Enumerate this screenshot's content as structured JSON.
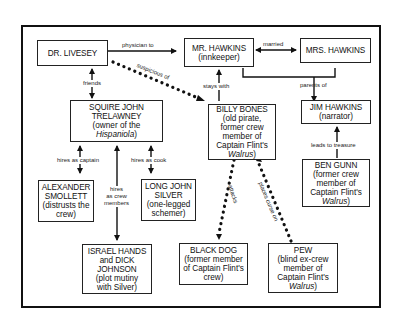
{
  "diagram": {
    "type": "character-relationship-map",
    "nodes": {
      "livesey": {
        "name": "DR. LIVESEY",
        "desc": ""
      },
      "mr_hawkins": {
        "name": "MR. HAWKINS",
        "desc": "(innkeeper)"
      },
      "mrs_hawkins": {
        "name": "MRS. HAWKINS",
        "desc": ""
      },
      "trelawney": {
        "name": "SQUIRE JOHN TRELAWNEY",
        "desc_pre": "(owner of the ",
        "desc_italic": "Hispaniola",
        "desc_post": ")"
      },
      "billy_bones": {
        "name": "BILLY BONES",
        "desc_pre": "(old pirate, former crew member of Captain Flint's ",
        "desc_italic": "Walrus",
        "desc_post": ")"
      },
      "jim_hawkins": {
        "name": "JIM HAWKINS",
        "desc": "(narrator)"
      },
      "ben_gunn": {
        "name": "BEN GUNN",
        "desc_pre": "(former crew member of Captain Flint's ",
        "desc_italic": "Walrus",
        "desc_post": ")"
      },
      "smollett": {
        "name": "ALEXANDER SMOLLETT",
        "desc": "(distrusts the crew)"
      },
      "silver": {
        "name": "LONG JOHN SILVER",
        "desc": "(one-legged schemer)"
      },
      "hands_johnson": {
        "name": "ISRAEL HANDS and DICK JOHNSON",
        "desc": "(plot mutiny with Silver)"
      },
      "black_dog": {
        "name": "BLACK DOG",
        "desc": "(former member of Captain Flint's crew)"
      },
      "pew": {
        "name": "PEW",
        "desc_pre": "(blind ex-crew member of Captain Flint's ",
        "desc_italic": "Walrus",
        "desc_post": ")"
      }
    },
    "edges": [
      {
        "from": "livesey",
        "to": "mr_hawkins",
        "label": "physician to",
        "style": "solid",
        "arrow": "forward"
      },
      {
        "from": "mr_hawkins",
        "to": "mrs_hawkins",
        "label": "married",
        "style": "solid",
        "arrow": "both"
      },
      {
        "from": "livesey",
        "to": "trelawney",
        "label": "friends",
        "style": "solid",
        "arrow": "both"
      },
      {
        "from": "livesey",
        "to": "billy_bones",
        "label": "suspicious of",
        "style": "dotted",
        "arrow": "forward"
      },
      {
        "from": "billy_bones",
        "to": "mr_hawkins",
        "label": "stays with",
        "style": "solid",
        "arrow": "forward"
      },
      {
        "from": "mr_hawkins+mrs_hawkins",
        "to": "jim_hawkins",
        "label": "parents of",
        "style": "solid",
        "arrow": "forward"
      },
      {
        "from": "ben_gunn",
        "to": "jim_hawkins",
        "label": "leads to treasure",
        "style": "solid",
        "arrow": "forward"
      },
      {
        "from": "trelawney",
        "to": "smollett",
        "label": "hires as captain",
        "style": "solid",
        "arrow": "both"
      },
      {
        "from": "trelawney",
        "to": "silver",
        "label": "hires as cook",
        "style": "solid",
        "arrow": "both"
      },
      {
        "from": "trelawney",
        "to": "hands_johnson",
        "label": "hires as crew members",
        "style": "solid",
        "arrow": "both"
      },
      {
        "from": "billy_bones",
        "to": "black_dog",
        "label": "attacks",
        "style": "dotted",
        "arrow": "forward"
      },
      {
        "from": "pew",
        "to": "billy_bones",
        "label": "places curse on",
        "style": "dotted",
        "arrow": "forward"
      }
    ],
    "labels": {
      "physician_to": "physician to",
      "married": "married",
      "friends": "friends",
      "suspicious_of": "suspicious of",
      "stays_with": "stays with",
      "parents_of": "parents of",
      "leads_to_treasure": "leads to treasure",
      "hires_as_captain": "hires as captain",
      "hires_as_cook": "hires as cook",
      "hires_line1": "hires",
      "hires_line2": "as crew",
      "hires_line3": "members",
      "attacks": "attacks",
      "places_curse_on": "places curse on"
    }
  }
}
